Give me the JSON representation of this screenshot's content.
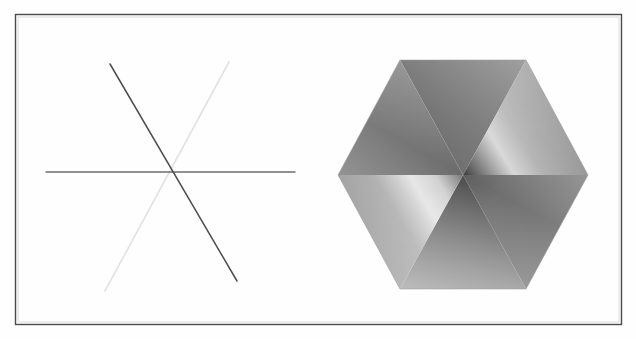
{
  "figure": {
    "type": "technical-illustration",
    "background_color": "#ffffff",
    "frame": {
      "name": "outer-border-rectangle",
      "x": 15,
      "y": 14,
      "width": 606,
      "height": 310,
      "stroke_color": "#4a4a4a",
      "stroke_width": 1.4
    },
    "panels": [
      {
        "id": "left-panel",
        "label": "wireframe-line-star",
        "description": "Three straight lines intersecting at one common point",
        "center": {
          "x": 171,
          "y": 172
        },
        "lines": [
          {
            "name": "horizontal-line",
            "x1": 46,
            "y1": 172,
            "x2": 295,
            "y2": 172,
            "color": "#6e6e6e",
            "width": 1.3
          },
          {
            "name": "dark-diagonal-line",
            "x1": 110,
            "y1": 64,
            "x2": 237,
            "y2": 281,
            "color": "#4d4d4d",
            "width": 1.5
          },
          {
            "name": "light-diagonal-line",
            "x1": 105,
            "y1": 291,
            "x2": 229,
            "y2": 62,
            "color": "#e2e2e2",
            "width": 1.6
          }
        ]
      },
      {
        "id": "right-panel",
        "label": "shaded-hexagon",
        "description": "Hexagon subdivided into six triangular facets with smooth gradient shading meeting at the center",
        "center": {
          "x": 463,
          "y": 175
        },
        "vertices": [
          {
            "name": "top-left-vertex",
            "x": 400,
            "y": 60
          },
          {
            "name": "top-right-vertex",
            "x": 526,
            "y": 60
          },
          {
            "name": "right-vertex",
            "x": 588,
            "y": 175
          },
          {
            "name": "bottom-right-vertex",
            "x": 526,
            "y": 289
          },
          {
            "name": "bottom-left-vertex",
            "x": 400,
            "y": 289
          },
          {
            "name": "left-vertex",
            "x": 338,
            "y": 175
          }
        ],
        "facets": [
          {
            "name": "facet-top",
            "center_tone": "#707070",
            "outer_tone": "#5a5a5a"
          },
          {
            "name": "facet-upper-right",
            "center_tone": "#3d3d3d",
            "outer_tone": "#d8d8d8"
          },
          {
            "name": "facet-lower-right",
            "center_tone": "#6a6a6a",
            "outer_tone": "#7a7a7a"
          },
          {
            "name": "facet-bottom",
            "center_tone": "#4f4f4f",
            "outer_tone": "#8d8d8d"
          },
          {
            "name": "facet-lower-left",
            "center_tone": "#8a8a8a",
            "outer_tone": "#e6e6e6"
          },
          {
            "name": "facet-upper-left",
            "center_tone": "#6b6b6b",
            "outer_tone": "#767676"
          }
        ],
        "outline_color": "#9a9a9a"
      }
    ]
  },
  "colors": {
    "page_background": "#ffffff",
    "frame_stroke": "#4a4a4a",
    "line_dark": "#4d4d4d",
    "line_mid": "#6e6e6e",
    "line_light": "#e2e2e2",
    "hexagon_highlight": "#efefef",
    "hexagon_shadow": "#3a3a3a"
  }
}
